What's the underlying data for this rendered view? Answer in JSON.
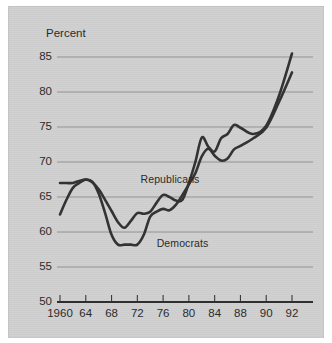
{
  "figure": {
    "background_color": "#cfcfcf",
    "page_color": "#ffffff",
    "ink_color": "#333333",
    "grid_color": "#8d8d8d"
  },
  "chart_data": {
    "type": "line",
    "title": "",
    "subtitle": "",
    "xlabel": "",
    "ylabel": "Percent",
    "ylim": [
      50,
      87
    ],
    "xlim": [
      1959,
      1993
    ],
    "yticks": [
      85,
      80,
      75,
      70,
      65,
      60,
      55,
      50
    ],
    "ytick_labels": [
      "85",
      "80",
      "75",
      "70",
      "65",
      "60",
      "55",
      "50"
    ],
    "xticks": [
      1960,
      1964,
      1968,
      1972,
      1976,
      1980,
      1984,
      1988,
      1990,
      1992
    ],
    "xtick_labels": [
      "1960",
      "64",
      "68",
      "72",
      "76",
      "80",
      "84",
      "88",
      "90",
      "92"
    ],
    "grid": "horizontal",
    "legend_position": "inline-annotation",
    "annotations": [
      {
        "text": "Republicans",
        "x": 1972.5,
        "y": 67.6
      },
      {
        "text": "Democrats",
        "x": 1975.0,
        "y": 58.5
      }
    ],
    "series": [
      {
        "name": "Republicans",
        "color": "#333333",
        "x": [
          1960,
          1961,
          1962,
          1963,
          1964,
          1965,
          1966,
          1967,
          1968,
          1969,
          1970,
          1971,
          1972,
          1973,
          1974,
          1975,
          1976,
          1977,
          1978,
          1979,
          1980,
          1981,
          1982,
          1983,
          1984,
          1985,
          1986,
          1987,
          1988,
          1989,
          1990,
          1991,
          1992
        ],
        "values": [
          67.0,
          67.0,
          67.0,
          67.3,
          67.5,
          67.1,
          66.1,
          64.6,
          63.0,
          61.4,
          60.6,
          61.6,
          62.7,
          62.6,
          62.9,
          64.2,
          65.3,
          65.0,
          64.5,
          64.6,
          67.0,
          70.0,
          73.5,
          72.2,
          71.5,
          73.4,
          74.0,
          75.3,
          74.9,
          74.0,
          75.2,
          79.5,
          85.5
        ]
      },
      {
        "name": "Democrats",
        "color": "#333333",
        "x": [
          1960,
          1961,
          1962,
          1963,
          1964,
          1965,
          1966,
          1967,
          1968,
          1969,
          1970,
          1971,
          1972,
          1973,
          1974,
          1975,
          1976,
          1977,
          1978,
          1979,
          1980,
          1981,
          1982,
          1983,
          1984,
          1985,
          1986,
          1987,
          1988,
          1989,
          1990,
          1991,
          1992
        ],
        "values": [
          62.5,
          64.6,
          66.3,
          67.0,
          67.5,
          67.2,
          65.5,
          62.7,
          59.6,
          58.2,
          58.2,
          58.2,
          58.2,
          59.6,
          62.2,
          62.9,
          63.3,
          63.1,
          63.9,
          65.3,
          66.8,
          68.4,
          70.8,
          71.9,
          70.9,
          70.2,
          70.5,
          71.8,
          72.3,
          73.4,
          74.9,
          78.6,
          82.8
        ]
      }
    ]
  }
}
